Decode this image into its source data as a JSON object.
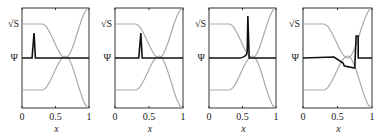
{
  "figure": {
    "panels": [
      {
        "frame": {
          "x": 22,
          "y": 8,
          "w": 67,
          "h": 100
        },
        "psi_spike_x": 0.18,
        "psi_type": "spike"
      },
      {
        "frame": {
          "x": 115,
          "y": 8,
          "w": 68,
          "h": 100
        },
        "psi_spike_x": 0.38,
        "psi_type": "spike"
      },
      {
        "frame": {
          "x": 209,
          "y": 8,
          "w": 67,
          "h": 100
        },
        "psi_spike_x": 0.58,
        "psi_type": "spike"
      },
      {
        "frame": {
          "x": 303,
          "y": 8,
          "w": 69,
          "h": 100
        },
        "psi_spike_x": 0.77,
        "psi_type": "step"
      }
    ],
    "ylabels": {
      "sqrtS": "√S",
      "psi": "Ψ"
    },
    "xticks": [
      "0",
      "0.5",
      "1"
    ],
    "xlabel": "x",
    "colors": {
      "frame": "#333333",
      "gray": "#aaaaaa",
      "psi": "#111111"
    }
  },
  "chart_data": [
    {
      "type": "line",
      "title": "",
      "xlabel": "x",
      "xlim": [
        0,
        1
      ],
      "xticks": [
        0,
        0.5,
        1
      ],
      "series": [
        {
          "name": "sqrt(S) upper",
          "x": [
            0,
            0.25,
            0.5,
            0.65,
            0.8,
            1
          ],
          "y": [
            0.8,
            0.8,
            0.6,
            0.45,
            0.75,
            1.0
          ]
        },
        {
          "name": "Psi",
          "description": "narrow spike at x≈0.18"
        },
        {
          "name": "lower curve",
          "x": [
            0,
            0.25,
            0.5,
            0.65,
            0.8,
            1
          ],
          "y": [
            0.2,
            0.2,
            0.4,
            0.55,
            0.25,
            0.0
          ]
        }
      ]
    },
    {
      "type": "line",
      "title": "",
      "xlabel": "x",
      "xlim": [
        0,
        1
      ],
      "xticks": [
        0,
        0.5,
        1
      ],
      "series": [
        {
          "name": "Psi",
          "description": "narrow spike at x≈0.38"
        }
      ]
    },
    {
      "type": "line",
      "title": "",
      "xlabel": "x",
      "xlim": [
        0,
        1
      ],
      "xticks": [
        0,
        0.5,
        1
      ],
      "series": [
        {
          "name": "Psi",
          "description": "tall spike at x≈0.58"
        }
      ]
    },
    {
      "type": "line",
      "title": "",
      "xlabel": "x",
      "xlim": [
        0,
        1
      ],
      "xticks": [
        0,
        0.5,
        1
      ],
      "series": [
        {
          "name": "Psi",
          "description": "step-down from x≈0.45 to 0.75 then spike at x≈0.77"
        }
      ]
    }
  ]
}
